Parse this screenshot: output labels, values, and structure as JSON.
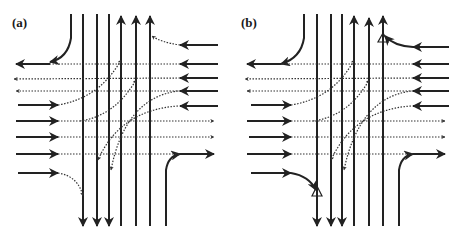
{
  "figure": {
    "panels": [
      {
        "id": "a",
        "label": "(a)",
        "conflict_markers": false
      },
      {
        "id": "b",
        "label": "(b)",
        "conflict_markers": true
      }
    ]
  },
  "colors": {
    "line": "#222222",
    "background": "#ffffff"
  }
}
